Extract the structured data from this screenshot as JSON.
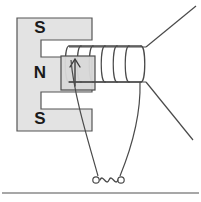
{
  "figure": {
    "background_color": "#ffffff",
    "width": 201,
    "height": 202
  },
  "magnet": {
    "name": "E-shaped core",
    "fill_color": "#e3e3e3",
    "stroke_color": "#555555",
    "outline": "M17,18 L92,18 L92,40 L41,40 L41,57 L92,57 L92,92 L41,92 L41,109 L92,109 L92,131 L17,131 Z",
    "poles": [
      {
        "label": "S",
        "x": 40,
        "y": 29
      },
      {
        "label": "N",
        "x": 40,
        "y": 74
      },
      {
        "label": "S",
        "x": 40,
        "y": 120
      }
    ]
  },
  "armature": {
    "name": "armature-core",
    "fill_color": "#d8d8d8",
    "stroke_color": "#4a4a4a",
    "x": 61,
    "y": 56,
    "width": 34,
    "height": 34,
    "arrow": {
      "name": "flux-direction-arrow",
      "from_y": 86,
      "to_y": 60,
      "x": 75,
      "color": "#3b3b3b"
    }
  },
  "coil": {
    "name": "solenoid-winding",
    "stroke_color": "#4a4a4a",
    "turns": 6,
    "x_start": 69,
    "x_end": 141,
    "y_top": 46,
    "y_bottom": 82,
    "loop_pitch": 12
  },
  "leads": {
    "stroke_color": "#4a4a4a",
    "upper_right": {
      "name": "lead-upper-right",
      "x1": 141,
      "y1": 47,
      "x2": 196,
      "y2": 6
    },
    "lower_right": {
      "name": "lead-lower-right",
      "x1": 141,
      "y1": 82,
      "x2": 193,
      "y2": 140
    },
    "left_down": {
      "name": "lead-to-source-left",
      "path": "M71,60 C74,96 88,140 98,176"
    },
    "right_down": {
      "name": "lead-to-source-right",
      "path": "M140,82 C140,118 128,154 120,176"
    }
  },
  "ac_source": {
    "name": "ac-source-symbol",
    "symbol": "~",
    "stroke_color": "#4a4a4a",
    "left_terminal": {
      "cx": 96,
      "cy": 180,
      "r": 3.2
    },
    "right_terminal": {
      "cx": 121,
      "cy": 180,
      "r": 3.2
    },
    "wave_path": "M100,180 C103,174 106,186 109,180 C112,174 115,186 118,180"
  },
  "divider": {
    "name": "bottom-divider-line",
    "color": "#8a8a8a",
    "y": 193,
    "x1": 2,
    "x2": 199
  }
}
